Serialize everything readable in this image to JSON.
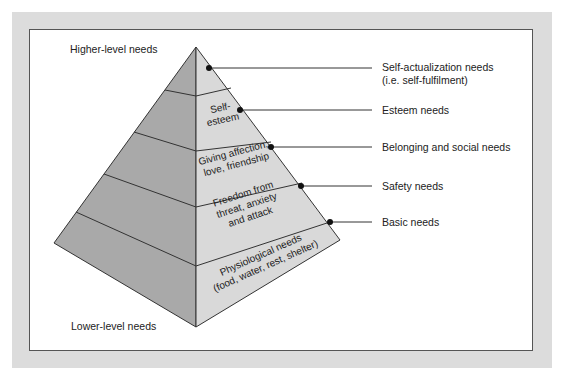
{
  "diagram": {
    "title_top": "Higher-level needs",
    "title_bottom": "Lower-level needs",
    "colors": {
      "background_outer": "#dcdcdc",
      "panel": "#ffffff",
      "left_face": "#a9a9a9",
      "right_face": "#d9d9d9",
      "line": "#333333"
    },
    "tiers": [
      {
        "inner_text": [],
        "label_lines": [
          "Self-actualization needs",
          "(i.e. self-fulfilment)"
        ]
      },
      {
        "inner_text": [
          "Self-",
          "esteem"
        ],
        "label_lines": [
          "Esteem needs"
        ]
      },
      {
        "inner_text": [
          "Giving affection,",
          "love, friendship"
        ],
        "label_lines": [
          "Belonging and social needs"
        ]
      },
      {
        "inner_text": [
          "Freedom from",
          "threat, anxiety",
          "and attack"
        ],
        "label_lines": [
          "Safety needs"
        ]
      },
      {
        "inner_text": [
          "Physiological needs",
          "(food, water, rest, shelter)"
        ],
        "label_lines": [
          "Basic needs"
        ]
      }
    ]
  }
}
